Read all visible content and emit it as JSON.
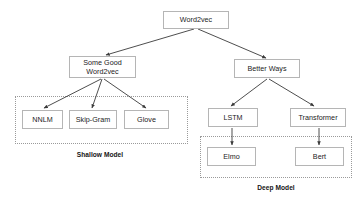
{
  "diagram": {
    "title_present": false,
    "background_color": "#ffffff",
    "node_border_color": "#b5b5b5",
    "group_border_color": "#9a9a9a",
    "edge_color": "#3a3a3a",
    "text_color": "#1b1b1b",
    "nodes": {
      "root": {
        "label": "Word2vec",
        "x": 163,
        "y": 11,
        "w": 66,
        "h": 18
      },
      "left_branch": {
        "label": "Some Good\nWord2vec",
        "x": 69,
        "y": 56,
        "w": 67,
        "h": 22
      },
      "right_branch": {
        "label": "Better Ways",
        "x": 234,
        "y": 59,
        "w": 66,
        "h": 19
      },
      "nnlm": {
        "label": "NNLM",
        "x": 22,
        "y": 110,
        "w": 41,
        "h": 19
      },
      "skipgram": {
        "label": "Skip-Gram",
        "x": 69,
        "y": 110,
        "w": 48,
        "h": 19
      },
      "glove": {
        "label": "Glove",
        "x": 124,
        "y": 110,
        "w": 45,
        "h": 19
      },
      "lstm": {
        "label": "LSTM",
        "x": 208,
        "y": 108,
        "w": 50,
        "h": 19
      },
      "transformer": {
        "label": "Transformer",
        "x": 290,
        "y": 108,
        "w": 56,
        "h": 19
      },
      "elmo": {
        "label": "Elmo",
        "x": 207,
        "y": 147,
        "w": 49,
        "h": 19
      },
      "bert": {
        "label": "Bert",
        "x": 295,
        "y": 147,
        "w": 49,
        "h": 19
      }
    },
    "groups": {
      "shallow": {
        "label": "Shallow Model",
        "box": {
          "x": 15,
          "y": 96,
          "w": 173,
          "h": 48
        },
        "label_x": 45,
        "label_y": 151,
        "label_w": 110
      },
      "deep": {
        "label": "Deep Model",
        "box": {
          "x": 200,
          "y": 136,
          "w": 152,
          "h": 42
        },
        "label_x": 221,
        "label_y": 184,
        "label_w": 110
      }
    },
    "edges": [
      {
        "name": "root-to-left-branch",
        "from": "root",
        "to": "left_branch",
        "x1": 194,
        "y1": 29,
        "x2": 106,
        "y2": 55
      },
      {
        "name": "root-to-right-branch",
        "from": "root",
        "to": "right_branch",
        "x1": 198,
        "y1": 29,
        "x2": 266,
        "y2": 58
      },
      {
        "name": "left-branch-to-nnlm",
        "from": "left_branch",
        "to": "nnlm",
        "x1": 101,
        "y1": 79,
        "x2": 44,
        "y2": 108
      },
      {
        "name": "left-branch-to-skipgram",
        "from": "left_branch",
        "to": "skipgram",
        "x1": 102,
        "y1": 79,
        "x2": 92,
        "y2": 108
      },
      {
        "name": "left-branch-to-glove",
        "from": "left_branch",
        "to": "glove",
        "x1": 104,
        "y1": 79,
        "x2": 146,
        "y2": 108
      },
      {
        "name": "right-branch-to-lstm",
        "from": "right_branch",
        "to": "lstm",
        "x1": 267,
        "y1": 79,
        "x2": 231,
        "y2": 106
      },
      {
        "name": "right-branch-to-transformer",
        "from": "right_branch",
        "to": "transformer",
        "x1": 269,
        "y1": 79,
        "x2": 314,
        "y2": 106
      },
      {
        "name": "lstm-to-elmo",
        "from": "lstm",
        "to": "elmo",
        "x1": 232,
        "y1": 128,
        "x2": 232,
        "y2": 145
      },
      {
        "name": "transformer-to-bert",
        "from": "transformer",
        "to": "bert",
        "x1": 319,
        "y1": 128,
        "x2": 319,
        "y2": 145
      }
    ]
  }
}
